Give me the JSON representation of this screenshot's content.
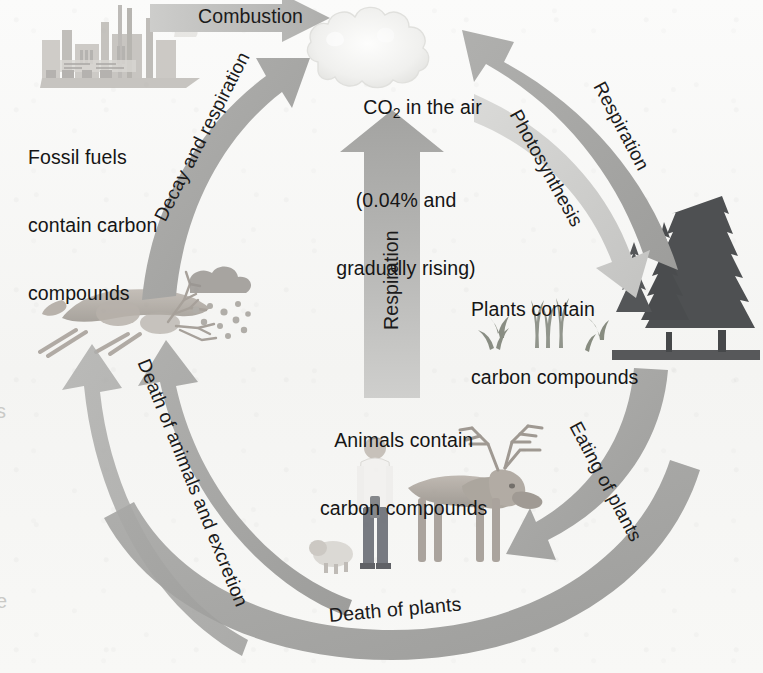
{
  "diagram": {
    "type": "cycle-diagram",
    "background_color": "#f7f7f5",
    "arrow_color": "#a9a9a7",
    "arrow_color_light": "#c6c6c4",
    "text_color": "#151515"
  },
  "nodes": [
    {
      "id": "atmosphere",
      "name": "co2-in-air",
      "lines": [
        "CO₂ in the air",
        "(0.04% and",
        "gradually rising)"
      ],
      "line1_pre": "CO",
      "line1_sub": "2",
      "line1_post": " in the air",
      "line2": "(0.04% and",
      "line3": "gradually rising)",
      "icon": "cloud",
      "x": 330,
      "y": 28
    },
    {
      "id": "fossil-fuels",
      "name": "fossil-fuels",
      "lines": [
        "Fossil fuels",
        "contain carbon",
        "compounds"
      ],
      "line1": "Fossil fuels",
      "line2": "contain carbon",
      "line3": "compounds",
      "icon": "factory",
      "x": 28,
      "y": 101
    },
    {
      "id": "plants",
      "name": "plants",
      "lines": [
        "Plants contain",
        "carbon compounds"
      ],
      "line1": "Plants contain",
      "line2": "carbon compounds",
      "icon": "forest",
      "x": 471,
      "y": 255
    },
    {
      "id": "animals",
      "name": "animals",
      "lines": [
        "Animals contain",
        "carbon compounds"
      ],
      "line1": "Animals contain",
      "line2": "carbon compounds",
      "icon": "deer-and-human",
      "x": 320,
      "y": 385
    }
  ],
  "flows": [
    {
      "id": "combustion",
      "label": "Combustion",
      "from": "fossil-fuels",
      "to": "atmosphere",
      "direction": "right"
    },
    {
      "id": "decay-respiration",
      "label": "Decay and respiration",
      "from": "decay",
      "to": "atmosphere",
      "direction": "up-right"
    },
    {
      "id": "respiration-right",
      "label": "Respiration",
      "from": "plants",
      "to": "atmosphere",
      "direction": "up-left"
    },
    {
      "id": "photosynthesis",
      "label": "Photosynthesis",
      "from": "atmosphere",
      "to": "plants",
      "direction": "down-right"
    },
    {
      "id": "respiration-centre",
      "label": "Respiration",
      "from": "animals",
      "to": "atmosphere",
      "direction": "up"
    },
    {
      "id": "eating-of-plants",
      "label": "Eating of plants",
      "from": "plants",
      "to": "animals",
      "direction": "down-left"
    },
    {
      "id": "death-of-plants",
      "label": "Death of plants",
      "from": "plants",
      "to": "decay",
      "direction": "left"
    },
    {
      "id": "death-of-animals",
      "label": "Death of animals and excretion",
      "from": "animals",
      "to": "decay",
      "direction": "up-left"
    }
  ],
  "edge_artifacts": {
    "left_upper": "s",
    "left_lower": "e"
  }
}
